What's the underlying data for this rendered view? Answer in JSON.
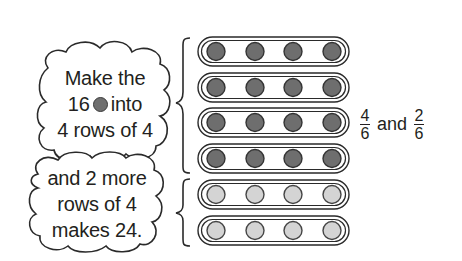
{
  "clouds": [
    {
      "lines": [
        "Make the",
        "16",
        "into",
        "4 rows of 4"
      ],
      "inline_icon": "dark-counter-icon"
    },
    {
      "lines": [
        "and 2 more",
        "rows of 4",
        "makes 24."
      ]
    }
  ],
  "arrays": {
    "groups": [
      {
        "rows": 4,
        "per_row": 4,
        "counter_color": "#6e6e6e",
        "counter_stroke": "#333333",
        "label": "dark group"
      },
      {
        "rows": 2,
        "per_row": 4,
        "counter_color": "#d4d4d4",
        "counter_stroke": "#444444",
        "label": "light group"
      }
    ],
    "total": 24
  },
  "fractions": {
    "first": {
      "numerator": "4",
      "denominator": "6"
    },
    "conjunction": "and",
    "second": {
      "numerator": "2",
      "denominator": "6"
    }
  }
}
